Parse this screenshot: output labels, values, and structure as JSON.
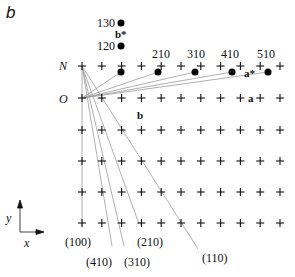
{
  "panel_label": "b",
  "row_labels": {
    "N": "N",
    "O": "O"
  },
  "grid": {
    "columns": 11,
    "x0": 82,
    "dx": 19.8,
    "rows_y": [
      66,
      98,
      130,
      161,
      192,
      223
    ],
    "cross_color": "#111111"
  },
  "origin": {
    "x": 82,
    "y": 98
  },
  "reciprocal_dots": [
    {
      "label": "210",
      "x": 121,
      "y": 72
    },
    {
      "label": "310",
      "x": 158,
      "y": 72
    },
    {
      "label": "410",
      "x": 195,
      "y": 72
    },
    {
      "label": "510",
      "x": 232,
      "y": 72
    },
    {
      "label": "",
      "x": 268,
      "y": 72
    }
  ],
  "dot_top_labels": [
    "210",
    "310",
    "410",
    "510"
  ],
  "b_star_dots": [
    {
      "label": "130",
      "x": 121,
      "y": 23
    },
    {
      "label": "120",
      "x": 121,
      "y": 46
    }
  ],
  "labels": {
    "l130": "130",
    "l120": "120",
    "l210": "210",
    "l310": "310",
    "l410": "410",
    "l510": "510",
    "b_star": "b*",
    "a_star": "a*",
    "a": "a",
    "b": "b",
    "axis_y": "y",
    "axis_x": "x"
  },
  "planes": [
    {
      "label": "(100)",
      "x_end": 82,
      "y_end": 230
    },
    {
      "label": "(410)",
      "x_end": 112,
      "y_end": 252
    },
    {
      "label": "(310)",
      "x_end": 124,
      "y_end": 252
    },
    {
      "label": "(210)",
      "x_end": 139,
      "y_end": 230
    },
    {
      "label": "(110)",
      "x_end": 198,
      "y_end": 255
    }
  ],
  "plane_labels": {
    "p100": "(100)",
    "p410": "(410)",
    "p310": "(310)",
    "p210": "(210)",
    "p110": "(110)"
  },
  "colors": {
    "line": "#9a9a9a",
    "ink": "#111111"
  }
}
